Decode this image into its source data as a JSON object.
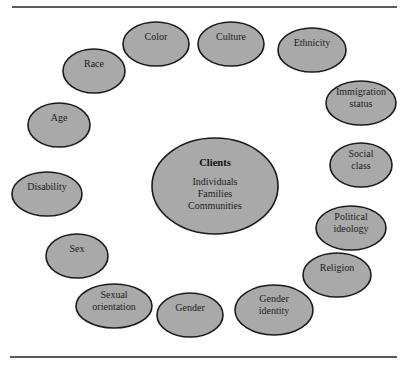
{
  "diagram": {
    "center": {
      "title": "Clients",
      "lines": [
        "Individuals",
        "Families",
        "Communities"
      ],
      "cx": 215,
      "cy": 186,
      "rx": 63,
      "ry": 48
    },
    "nodes": [
      {
        "id": "color",
        "lines": [
          "Color"
        ],
        "cx": 156,
        "cy": 44,
        "rx": 33,
        "ry": 22
      },
      {
        "id": "culture",
        "lines": [
          "Culture"
        ],
        "cx": 231,
        "cy": 44,
        "rx": 33,
        "ry": 22
      },
      {
        "id": "ethnicity",
        "lines": [
          "Ethnicity"
        ],
        "cx": 312,
        "cy": 50,
        "rx": 34,
        "ry": 22
      },
      {
        "id": "immigration-status",
        "lines": [
          "Immigration",
          "status"
        ],
        "cx": 361,
        "cy": 103,
        "rx": 35,
        "ry": 22
      },
      {
        "id": "social-class",
        "lines": [
          "Social",
          "class"
        ],
        "cx": 361,
        "cy": 165,
        "rx": 31,
        "ry": 22
      },
      {
        "id": "political-ideology",
        "lines": [
          "Political",
          "ideology"
        ],
        "cx": 351,
        "cy": 228,
        "rx": 35,
        "ry": 22
      },
      {
        "id": "religion",
        "lines": [
          "Religion"
        ],
        "cx": 337,
        "cy": 275,
        "rx": 34,
        "ry": 22
      },
      {
        "id": "gender-identity",
        "lines": [
          "Gender",
          "identity"
        ],
        "cx": 274,
        "cy": 310,
        "rx": 39,
        "ry": 25
      },
      {
        "id": "gender",
        "lines": [
          "Gender"
        ],
        "cx": 190,
        "cy": 315,
        "rx": 33,
        "ry": 22
      },
      {
        "id": "sexual-orientation",
        "lines": [
          "Sexual",
          "orientation"
        ],
        "cx": 114,
        "cy": 306,
        "rx": 38,
        "ry": 22
      },
      {
        "id": "sex",
        "lines": [
          "Sex"
        ],
        "cx": 77,
        "cy": 256,
        "rx": 31,
        "ry": 22
      },
      {
        "id": "disability",
        "lines": [
          "Disability"
        ],
        "cx": 47,
        "cy": 194,
        "rx": 35,
        "ry": 22
      },
      {
        "id": "age",
        "lines": [
          "Age"
        ],
        "cx": 59,
        "cy": 125,
        "rx": 31,
        "ry": 22
      },
      {
        "id": "race",
        "lines": [
          "Race"
        ],
        "cx": 94,
        "cy": 71,
        "rx": 31,
        "ry": 22
      }
    ],
    "colors": {
      "ellipse_fill": "#a9a9a9",
      "ellipse_stroke": "#1a1a1a",
      "rule": "#222222",
      "background": "#ffffff"
    }
  }
}
